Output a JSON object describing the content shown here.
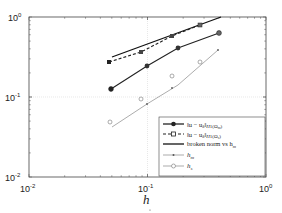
{
  "chart_data": {
    "type": "line",
    "title": "",
    "xlabel": "h",
    "ylabel": "",
    "xscale": "log",
    "yscale": "log",
    "xlim": [
      0.01,
      1
    ],
    "ylim": [
      0.01,
      1
    ],
    "grid": true,
    "legend_position": "lower right",
    "x_tick_labels": [
      "10^-2",
      "10^-1",
      "10^0"
    ],
    "y_tick_labels": [
      "10^-2",
      "10^-1",
      "10^0"
    ],
    "series": [
      {
        "name": "||u - u_δ||_H1(Ω_m)",
        "style": "solid, filled circle markers",
        "color": "#222222",
        "x": [
          0.05,
          0.1,
          0.18,
          0.42
        ],
        "y": [
          0.075,
          0.14,
          0.23,
          0.43
        ]
      },
      {
        "name": "||u - u_δ||_H1(Ω_s)",
        "style": "dashed, filled square markers",
        "color": "#222222",
        "x": [
          0.05,
          0.09,
          0.16,
          0.27
        ],
        "y": [
          0.13,
          0.18,
          0.3,
          0.41
        ]
      },
      {
        "name": "broken norm vs h_m",
        "style": "solid, no markers",
        "color": "#111111",
        "x": [
          0.05,
          0.35
        ],
        "y": [
          0.15,
          1.0
        ]
      },
      {
        "name": "h_m",
        "style": "thin solid, dot markers",
        "color": "#888888",
        "x": [
          0.05,
          0.1,
          0.2,
          0.42
        ],
        "y": [
          0.05,
          0.1,
          0.2,
          0.42
        ]
      },
      {
        "name": "h_s",
        "style": "thin solid, open circle markers",
        "color": "#888888",
        "x": [
          0.05,
          0.09,
          0.16,
          0.27
        ],
        "y": [
          0.05,
          0.09,
          0.16,
          0.27
        ]
      }
    ]
  },
  "axes": {
    "x_ticks": [
      {
        "base": "10",
        "exp": "-2"
      },
      {
        "base": "10",
        "exp": "-1"
      },
      {
        "base": "10",
        "exp": "0"
      }
    ],
    "y_ticks": [
      {
        "base": "10",
        "exp": "-2"
      },
      {
        "base": "10",
        "exp": "-1"
      },
      {
        "base": "10",
        "exp": "0"
      }
    ],
    "xlabel": "h"
  },
  "legend": {
    "items": [
      {
        "label": "‖u − u",
        "sub": "δ",
        "tail": "‖",
        "norm": "H",
        "normsup": "1",
        "domain": "(Ω",
        "dsub": "m",
        "close": ")"
      },
      {
        "label": "‖u − u",
        "sub": "δ",
        "tail": "‖",
        "norm": "H",
        "normsup": "1",
        "domain": "(Ω",
        "dsub": "s",
        "close": ")"
      },
      {
        "label": "broken norm vs h",
        "sub": "m"
      },
      {
        "label": "h",
        "sub": "m"
      },
      {
        "label": "h",
        "sub": "s"
      }
    ]
  }
}
